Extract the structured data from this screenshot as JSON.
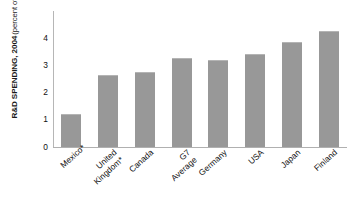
{
  "chart_data": {
    "type": "bar",
    "title": "",
    "subtitle": "",
    "xlabel": "",
    "ylabel": "R&D SPENDING, 2004 (percent of GDP)",
    "ylabel_main": "R&D SPENDING, 2004",
    "ylabel_sub": "(percent of GDP)",
    "categories": [
      "Mexico*",
      "United\nKingdom*",
      "Canada",
      "G7\nAverage",
      "Germany",
      "USA",
      "Japan",
      "Finland"
    ],
    "values": [
      1.2,
      2.65,
      2.75,
      3.25,
      3.2,
      3.4,
      3.85,
      4.25
    ],
    "ylim": [
      0,
      5
    ],
    "yticks": [
      0,
      1,
      2,
      3,
      4
    ],
    "ytick_labels": [
      "0",
      "1",
      "2",
      "3",
      "4"
    ],
    "grid": false,
    "legend": null,
    "legend_position": "none",
    "bar_color": "#989898",
    "axis_color": "#b0b0b0",
    "text_color": "#111111",
    "background_color": "#ffffff",
    "xtick_rotation": -42,
    "annotations": [
      "Asterisk on Mexico and United Kingdom labels"
    ]
  }
}
